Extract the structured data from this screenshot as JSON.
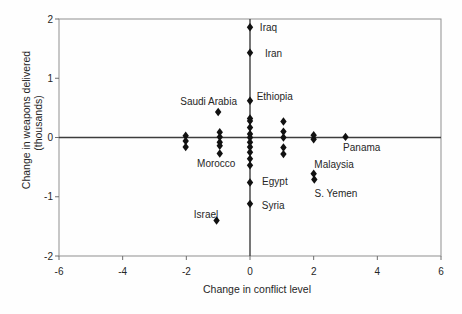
{
  "chart_data": {
    "type": "scatter",
    "title": "",
    "xlabel": "Change in conflict level",
    "ylabel_line1": "Change in weapons delivered",
    "ylabel_line2": "(thousands)",
    "xlim": [
      -6,
      6
    ],
    "ylim": [
      -2,
      2
    ],
    "x_ticks": [
      -6,
      -4,
      -2,
      0,
      2,
      4,
      6
    ],
    "y_ticks": [
      2,
      1,
      0,
      -1,
      -2
    ],
    "grid": false,
    "zero_reference_lines": true,
    "legend": "none",
    "marker": "diamond",
    "colors": {
      "marker": "#111111",
      "frame": "#8f8f8f",
      "zero_line": "#3d3d3d",
      "tick": "#6e6e6e",
      "text": "#262626",
      "background": "#fefefe"
    },
    "labeled_points": [
      {
        "label": "Iraq",
        "x": 0.0,
        "y": 1.86,
        "lx": 0.31,
        "ly": 1.86,
        "anchor": "start"
      },
      {
        "label": "Iran",
        "x": 0.0,
        "y": 1.43,
        "lx": 0.47,
        "ly": 1.42,
        "anchor": "start"
      },
      {
        "label": "Ethiopia",
        "x": 0.0,
        "y": 0.62,
        "lx": 0.21,
        "ly": 0.7,
        "anchor": "start"
      },
      {
        "label": "Saudi Arabia",
        "x": -1.0,
        "y": 0.43,
        "lx": -1.3,
        "ly": 0.6,
        "anchor": "middle"
      },
      {
        "label": "Panama",
        "x": 3.0,
        "y": 0.01,
        "lx": 3.51,
        "ly": -0.17,
        "anchor": "middle"
      },
      {
        "label": "Morocco",
        "x": -0.95,
        "y": -0.27,
        "lx": -1.06,
        "ly": -0.44,
        "anchor": "middle"
      },
      {
        "label": "Malaysia",
        "x": 2.0,
        "y": -0.61,
        "lx": 2.64,
        "ly": -0.45,
        "anchor": "middle"
      },
      {
        "label": "S. Yemen",
        "x": 2.02,
        "y": -0.71,
        "lx": 2.7,
        "ly": -0.94,
        "anchor": "middle"
      },
      {
        "label": "Egypt",
        "x": 0.0,
        "y": -0.76,
        "lx": 0.38,
        "ly": -0.75,
        "anchor": "start"
      },
      {
        "label": "Syria",
        "x": 0.0,
        "y": -1.12,
        "lx": 0.37,
        "ly": -1.14,
        "anchor": "start"
      },
      {
        "label": "Israel",
        "x": -1.05,
        "y": -1.4,
        "lx": -1.38,
        "ly": -1.3,
        "anchor": "middle"
      }
    ],
    "unlabeled_points": [
      [
        0,
        0.32
      ],
      [
        0,
        0.28
      ],
      [
        0,
        0.17
      ],
      [
        0,
        0.06
      ],
      [
        0,
        0.0
      ],
      [
        0,
        -0.08
      ],
      [
        0,
        -0.16
      ],
      [
        0,
        -0.25
      ],
      [
        0,
        -0.36
      ],
      [
        0,
        -0.47
      ],
      [
        1.05,
        0.27
      ],
      [
        1.05,
        0.1
      ],
      [
        1.05,
        0.0
      ],
      [
        1.05,
        -0.17
      ],
      [
        1.05,
        -0.28
      ],
      [
        2.0,
        0.04
      ],
      [
        2.0,
        -0.03
      ],
      [
        -0.95,
        0.09
      ],
      [
        -0.95,
        0.01
      ],
      [
        -0.95,
        -0.08
      ],
      [
        -0.95,
        -0.14
      ],
      [
        -2.02,
        0.03
      ],
      [
        -2.02,
        -0.06
      ],
      [
        -2.02,
        -0.16
      ]
    ]
  }
}
